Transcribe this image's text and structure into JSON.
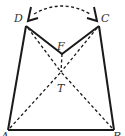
{
  "diagram": {
    "type": "geometry-folding",
    "colors": {
      "line": "#1a1a1a",
      "label": "#333333",
      "background": "#ffffff"
    },
    "points": {
      "A": {
        "label": "A",
        "x": 8,
        "y": 130
      },
      "B": {
        "label": "B",
        "x": 114,
        "y": 130
      },
      "C": {
        "label": "C",
        "x": 97,
        "y": 22
      },
      "D": {
        "label": "D",
        "x": 28,
        "y": 22
      },
      "F": {
        "label": "F",
        "x": 62,
        "y": 54
      },
      "T": {
        "label": "T",
        "x": 61,
        "y": 72
      }
    },
    "solid_segments": [
      "A-B",
      "A-D",
      "B-C",
      "D-F",
      "F-C"
    ],
    "dashed_segments": [
      "A-T",
      "T-F",
      "B-T",
      "D-T",
      "C-T"
    ],
    "dashed_arc": "between folded tips at D and C",
    "labels": {
      "A": "A",
      "B": "B",
      "C": "C",
      "D": "D",
      "F": "F",
      "T": "T"
    }
  }
}
